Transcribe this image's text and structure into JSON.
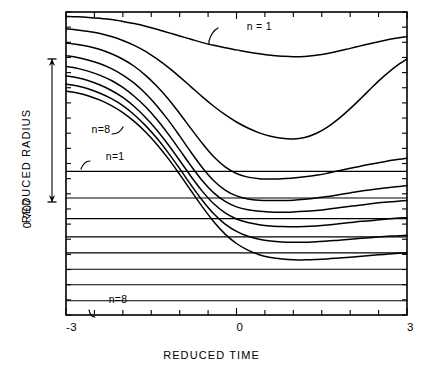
{
  "chart_data": {
    "type": "line",
    "title": "",
    "xlabel": "REDUCED TIME",
    "ylabel": "REDUCED RADIUS",
    "xlim": [
      -3,
      3
    ],
    "ylim": [
      0,
      1
    ],
    "xticks": [
      -3,
      0,
      3
    ],
    "xticklabels": [
      "-3",
      "0",
      "3"
    ],
    "xminortick_step": 0.5,
    "yticks": [],
    "yticklabels": [],
    "grid": false,
    "legend": "none",
    "scale_annotation": {
      "label": "0.707",
      "y_top": 0.845,
      "y_bottom": 0.373,
      "description": "vertical double-headed arrow measuring 0.707 of reduced radius"
    },
    "annotations": [
      {
        "text": "n = 1",
        "x": 0.18,
        "y": 0.955,
        "target_series": "n = 1",
        "leader": "down-left"
      },
      {
        "text": "n=8",
        "x": -2.55,
        "y": 0.615,
        "target_series": "n = 8",
        "leader": "up-right"
      },
      {
        "text": "n=1",
        "x": -2.3,
        "y": 0.525,
        "target_series": "level n = 1",
        "leader": "down-left"
      },
      {
        "text": "n=8",
        "x": -2.25,
        "y": 0.052,
        "target_series": "level n = 8",
        "leader": "up-left"
      }
    ],
    "reference_levels": {
      "description": "horizontal asymptote lines, one per n",
      "names": [
        "n = 1",
        "n = 2",
        "n = 3",
        "n = 4",
        "n = 5",
        "n = 6",
        "n = 7",
        "n = 8"
      ],
      "values": [
        0.474,
        0.386,
        0.318,
        0.258,
        0.205,
        0.151,
        0.1,
        0.047
      ]
    },
    "x": [
      -3.0,
      -2.8,
      -2.6,
      -2.4,
      -2.2,
      -2.0,
      -1.8,
      -1.6,
      -1.4,
      -1.2,
      -1.0,
      -0.8,
      -0.6,
      -0.4,
      -0.2,
      0.0,
      0.2,
      0.4,
      0.6,
      0.8,
      1.0,
      1.2,
      1.4,
      1.6,
      1.8,
      2.0,
      2.2,
      2.4,
      2.6,
      2.8,
      3.0
    ],
    "series": [
      {
        "name": "n = 1",
        "values": [
          0.985,
          0.984,
          0.982,
          0.979,
          0.975,
          0.969,
          0.962,
          0.953,
          0.943,
          0.932,
          0.921,
          0.91,
          0.899,
          0.89,
          0.882,
          0.875,
          0.868,
          0.862,
          0.857,
          0.854,
          0.852,
          0.853,
          0.857,
          0.863,
          0.871,
          0.88,
          0.889,
          0.898,
          0.906,
          0.913,
          0.919
        ]
      },
      {
        "name": "n = 2",
        "values": [
          0.944,
          0.941,
          0.936,
          0.929,
          0.919,
          0.906,
          0.89,
          0.87,
          0.845,
          0.817,
          0.786,
          0.753,
          0.72,
          0.689,
          0.661,
          0.637,
          0.617,
          0.601,
          0.59,
          0.583,
          0.581,
          0.586,
          0.599,
          0.62,
          0.648,
          0.681,
          0.717,
          0.754,
          0.789,
          0.82,
          0.845
        ]
      },
      {
        "name": "n = 3",
        "values": [
          0.898,
          0.893,
          0.886,
          0.876,
          0.862,
          0.844,
          0.821,
          0.791,
          0.755,
          0.713,
          0.665,
          0.615,
          0.566,
          0.522,
          0.489,
          0.467,
          0.455,
          0.45,
          0.449,
          0.45,
          0.452,
          0.456,
          0.461,
          0.468,
          0.476,
          0.484,
          0.492,
          0.499,
          0.506,
          0.512,
          0.517
        ]
      },
      {
        "name": "n = 4",
        "values": [
          0.856,
          0.85,
          0.841,
          0.829,
          0.813,
          0.792,
          0.765,
          0.731,
          0.69,
          0.643,
          0.591,
          0.537,
          0.486,
          0.443,
          0.412,
          0.393,
          0.383,
          0.379,
          0.378,
          0.378,
          0.379,
          0.382,
          0.386,
          0.391,
          0.397,
          0.403,
          0.409,
          0.414,
          0.419,
          0.423,
          0.427
        ]
      },
      {
        "name": "n = 5",
        "values": [
          0.82,
          0.814,
          0.804,
          0.791,
          0.774,
          0.751,
          0.722,
          0.687,
          0.645,
          0.597,
          0.545,
          0.492,
          0.443,
          0.403,
          0.375,
          0.357,
          0.347,
          0.342,
          0.34,
          0.339,
          0.34,
          0.342,
          0.345,
          0.349,
          0.354,
          0.359,
          0.363,
          0.368,
          0.372,
          0.375,
          0.378
        ]
      },
      {
        "name": "n = 6",
        "values": [
          0.789,
          0.783,
          0.773,
          0.759,
          0.741,
          0.718,
          0.688,
          0.652,
          0.61,
          0.562,
          0.51,
          0.457,
          0.408,
          0.367,
          0.337,
          0.317,
          0.305,
          0.298,
          0.294,
          0.292,
          0.291,
          0.292,
          0.294,
          0.297,
          0.301,
          0.305,
          0.309,
          0.312,
          0.316,
          0.319,
          0.321
        ]
      },
      {
        "name": "n = 7",
        "values": [
          0.762,
          0.756,
          0.746,
          0.732,
          0.714,
          0.691,
          0.661,
          0.625,
          0.583,
          0.535,
          0.483,
          0.429,
          0.378,
          0.334,
          0.3,
          0.276,
          0.26,
          0.25,
          0.244,
          0.241,
          0.24,
          0.24,
          0.242,
          0.244,
          0.247,
          0.25,
          0.253,
          0.256,
          0.259,
          0.261,
          0.263
        ]
      },
      {
        "name": "n = 8",
        "values": [
          0.739,
          0.733,
          0.723,
          0.709,
          0.691,
          0.668,
          0.639,
          0.604,
          0.563,
          0.516,
          0.464,
          0.41,
          0.357,
          0.308,
          0.267,
          0.236,
          0.214,
          0.199,
          0.19,
          0.185,
          0.182,
          0.182,
          0.183,
          0.185,
          0.188,
          0.191,
          0.194,
          0.197,
          0.2,
          0.203,
          0.205
        ]
      }
    ]
  },
  "axes": {
    "x_title": "REDUCED TIME",
    "y_title": "REDUCED RADIUS",
    "x_tick_labels": [
      "-3",
      "0",
      "3"
    ],
    "scale_label": "0.707"
  },
  "labels": {
    "top_curve": "n = 1",
    "upper_left_curve": "n=8",
    "upper_left_level": "n=1",
    "bottom_left_level": "n=8"
  },
  "style": {
    "line_color": "#000000",
    "frame_color": "#000000",
    "background": "#ffffff"
  }
}
